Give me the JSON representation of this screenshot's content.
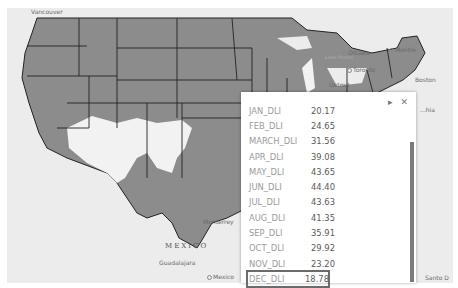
{
  "map": {
    "labels": {
      "vancouver": "Vancouver",
      "ottawa": "Ottawa",
      "montreal": "Montré",
      "lake_superior": "Lake Superior",
      "lake_huron": "Lake Huron",
      "toronto": "Toronto",
      "detroit": "Detroit",
      "boston": "Boston",
      "philadelphia": "...hia",
      "monterrey": "Monterrey",
      "mexico_country": "MEXICO",
      "guadalajara": "Guadalajara",
      "mexico_city": "Mexico",
      "santo_domingo": "Santo D"
    },
    "colors": {
      "land_dli": "#8c8c8c",
      "low_dli": "#f4f4f4",
      "background": "#ececec",
      "borders": "#222222"
    }
  },
  "popup": {
    "tools": {
      "next": "▸",
      "close": "✕"
    },
    "rows": [
      {
        "key": "JAN_DLI",
        "value": "20.17"
      },
      {
        "key": "FEB_DLI",
        "value": "24.65"
      },
      {
        "key": "MARCH_DLI",
        "value": "31.56"
      },
      {
        "key": "APR_DLI",
        "value": "39.08"
      },
      {
        "key": "MAY_DLI",
        "value": "43.65"
      },
      {
        "key": "JUN_DLI",
        "value": "44.40"
      },
      {
        "key": "JUL_DLI",
        "value": "43.63"
      },
      {
        "key": "AUG_DLI",
        "value": "41.35"
      },
      {
        "key": "SEP_DLI",
        "value": "35.91"
      },
      {
        "key": "OCT_DLI",
        "value": "29.92"
      },
      {
        "key": "NOV_DLI",
        "value": "23.20"
      },
      {
        "key": "DEC_DLI",
        "value": "18.78"
      }
    ],
    "highlighted_row": "DEC_DLI"
  }
}
